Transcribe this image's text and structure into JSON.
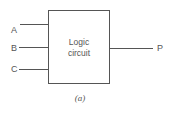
{
  "diagram": {
    "type": "block-diagram",
    "block": {
      "label_line1": "Logic",
      "label_line2": "circuit"
    },
    "inputs": [
      {
        "label": "A"
      },
      {
        "label": "B"
      },
      {
        "label": "C"
      }
    ],
    "outputs": [
      {
        "label": "P"
      }
    ],
    "caption": "(a)",
    "colors": {
      "line": "#555555",
      "text": "#555555",
      "background": "#ffffff"
    }
  }
}
